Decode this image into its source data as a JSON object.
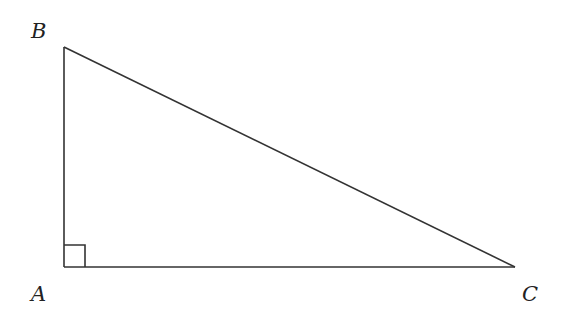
{
  "diagram": {
    "type": "right-triangle",
    "vertices": {
      "A": {
        "label": "A",
        "x": 64,
        "y": 267
      },
      "B": {
        "label": "B",
        "x": 64,
        "y": 47
      },
      "C": {
        "label": "C",
        "x": 515,
        "y": 267
      }
    },
    "right_angle_at": "A",
    "edges": [
      [
        "A",
        "B"
      ],
      [
        "B",
        "C"
      ],
      [
        "A",
        "C"
      ]
    ],
    "colors": {
      "stroke": "#333333",
      "label": "#222222",
      "background": "#ffffff"
    }
  }
}
